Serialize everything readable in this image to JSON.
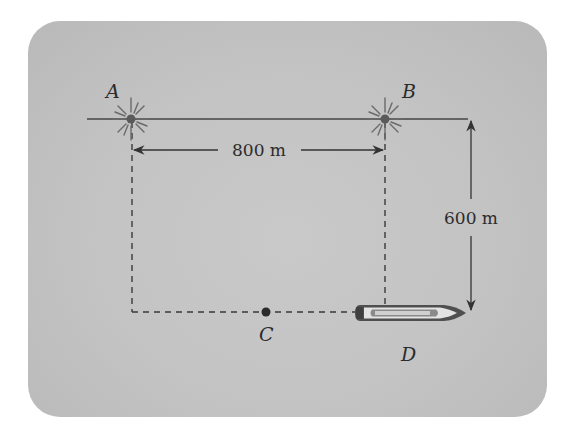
{
  "diagram": {
    "points": [
      {
        "id": "A",
        "label": "A",
        "type": "light-beacon"
      },
      {
        "id": "B",
        "label": "B",
        "type": "light-beacon"
      },
      {
        "id": "C",
        "label": "C",
        "type": "dot"
      },
      {
        "id": "D",
        "label": "D",
        "type": "boat"
      }
    ],
    "dimensions": {
      "horizontal": "800 m",
      "vertical": "600 m"
    },
    "colors": {
      "background": "#c4c4c4",
      "line": "#3a3a3a",
      "text": "#2b2b2b"
    }
  }
}
